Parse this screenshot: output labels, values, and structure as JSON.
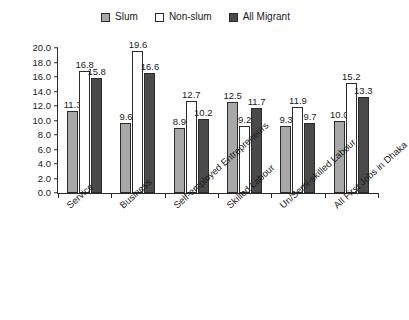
{
  "legend": {
    "entries": [
      {
        "label": "Slum",
        "color": "#a8a8a8",
        "icon": "square-swatch-icon"
      },
      {
        "label": "Non-slum",
        "color": "#ffffff",
        "icon": "square-swatch-icon"
      },
      {
        "label": "All Migrant",
        "color": "#4a4a4a",
        "icon": "square-swatch-icon"
      }
    ]
  },
  "axis": {
    "yticks": [
      "0.0",
      "2.0",
      "4.0",
      "6.0",
      "8.0",
      "10.0",
      "12.0",
      "14.0",
      "16.0",
      "18.0",
      "20.0"
    ]
  },
  "chart_data": {
    "type": "bar",
    "title": "",
    "xlabel": "",
    "ylabel": "",
    "ylim": [
      0,
      20
    ],
    "ytick_step": 2,
    "grid": false,
    "legend_position": "top-center",
    "categories": [
      "Service",
      "Business",
      "Self-employed Entrepreneurs",
      "Skilled Labour",
      "Un/Semi-skilled Labour",
      "All First Jobs in Dhaka"
    ],
    "series": [
      {
        "name": "Slum",
        "color": "#a8a8a8",
        "values": [
          11.3,
          9.6,
          8.9,
          12.5,
          9.3,
          10.0
        ]
      },
      {
        "name": "Non-slum",
        "color": "#ffffff",
        "values": [
          16.8,
          19.6,
          12.7,
          9.2,
          11.9,
          15.2
        ]
      },
      {
        "name": "All Migrant",
        "color": "#4a4a4a",
        "values": [
          15.8,
          16.6,
          10.2,
          11.7,
          9.7,
          13.3
        ]
      }
    ],
    "data_labels": [
      [
        "11.3",
        "16.8",
        "15.8"
      ],
      [
        "9.6",
        "19.6",
        "16.6"
      ],
      [
        "8.9",
        "12.7",
        "10.2"
      ],
      [
        "12.5",
        "9.2",
        "11.7"
      ],
      [
        "9.3",
        "11.9",
        "9.7"
      ],
      [
        "10.0",
        "15.2",
        "13.3"
      ]
    ]
  }
}
